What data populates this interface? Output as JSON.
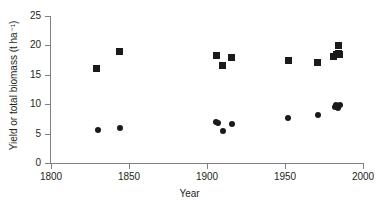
{
  "chart_data": {
    "type": "scatter",
    "title": "",
    "xlabel": "Year",
    "ylabel": "Yield or total biomass (t ha⁻¹)",
    "xlim": [
      1800,
      2000
    ],
    "ylim": [
      0,
      25
    ],
    "xticks": [
      1800,
      1850,
      1900,
      1950,
      2000
    ],
    "yticks": [
      0,
      5,
      10,
      15,
      20,
      25
    ],
    "grid": false,
    "legend": "none",
    "series": [
      {
        "name": "total biomass",
        "marker": "square",
        "color": "#1a1a1a",
        "points": [
          {
            "x": 1829,
            "y": 16.1
          },
          {
            "x": 1844,
            "y": 18.9
          },
          {
            "x": 1906,
            "y": 18.2
          },
          {
            "x": 1910,
            "y": 16.5
          },
          {
            "x": 1916,
            "y": 18.0
          },
          {
            "x": 1952,
            "y": 17.5
          },
          {
            "x": 1971,
            "y": 17.1
          },
          {
            "x": 1981,
            "y": 18.1
          },
          {
            "x": 1983,
            "y": 18.4
          },
          {
            "x": 1984,
            "y": 18.6
          },
          {
            "x": 1984,
            "y": 19.9
          },
          {
            "x": 1985,
            "y": 18.4
          }
        ]
      },
      {
        "name": "yield",
        "marker": "circle",
        "color": "#1a1a1a",
        "points": [
          {
            "x": 1830,
            "y": 5.6
          },
          {
            "x": 1844,
            "y": 5.9
          },
          {
            "x": 1906,
            "y": 7.0
          },
          {
            "x": 1907,
            "y": 6.8
          },
          {
            "x": 1910,
            "y": 5.4
          },
          {
            "x": 1916,
            "y": 6.6
          },
          {
            "x": 1952,
            "y": 7.7
          },
          {
            "x": 1971,
            "y": 8.2
          },
          {
            "x": 1982,
            "y": 9.6
          },
          {
            "x": 1983,
            "y": 9.8
          },
          {
            "x": 1984,
            "y": 9.3
          },
          {
            "x": 1985,
            "y": 9.8
          }
        ]
      }
    ]
  },
  "axis": {
    "x_tick_labels": [
      "1800",
      "1850",
      "1900",
      "1950",
      "2000"
    ],
    "y_tick_labels": [
      "0",
      "5",
      "10",
      "15",
      "20",
      "25"
    ],
    "x_title": "Year",
    "y_title": "Yield or total biomass (t ha⁻¹)"
  },
  "colors": {
    "marker": "#1a1a1a",
    "axis": "#808080",
    "text": "#231f20",
    "background": "#ffffff"
  }
}
